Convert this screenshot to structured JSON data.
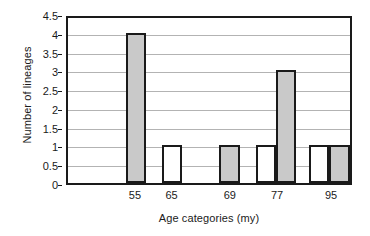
{
  "chart_data": {
    "type": "bar",
    "title": "",
    "xlabel": "Age categories (my)",
    "ylabel": "Number of lineages",
    "categories": [
      "55",
      "65",
      "69",
      "77",
      "95"
    ],
    "values": [
      4,
      1,
      1,
      3,
      1
    ],
    "ylim": [
      0,
      4.5
    ],
    "yticks": [
      "0",
      "0.5",
      "1",
      "1.5",
      "2",
      "2.5",
      "3",
      "3.5",
      "4",
      "4.5"
    ],
    "ytick_values": [
      0,
      0.5,
      1,
      1.5,
      2,
      2.5,
      3,
      3.5,
      4,
      4.5
    ],
    "grid": true,
    "legend": "none",
    "bar_colors": {
      "filled": "#c9c9c9",
      "empty": "#ffffff",
      "outline": "#1a1a1a"
    },
    "bars": [
      {
        "category": "55",
        "value": 4,
        "fill": "filled",
        "x_frac": 0.205,
        "width_frac": 0.072
      },
      {
        "category": "65",
        "value": 1,
        "fill": "empty",
        "x_frac": 0.333,
        "width_frac": 0.072
      },
      {
        "category": "69",
        "value": 1,
        "fill": "filled",
        "x_frac": 0.537,
        "width_frac": 0.072
      },
      {
        "category": "77",
        "value": 1,
        "fill": "empty",
        "x_frac": 0.666,
        "width_frac": 0.072
      },
      {
        "category": "77",
        "value": 3,
        "fill": "filled",
        "x_frac": 0.738,
        "width_frac": 0.072
      },
      {
        "category": "95",
        "value": 1,
        "fill": "empty",
        "x_frac": 0.855,
        "width_frac": 0.072
      },
      {
        "category": "95",
        "value": 1,
        "fill": "filled",
        "x_frac": 0.927,
        "width_frac": 0.072
      }
    ],
    "xtick_positions": [
      0.241,
      0.369,
      0.573,
      0.738,
      0.927
    ]
  }
}
